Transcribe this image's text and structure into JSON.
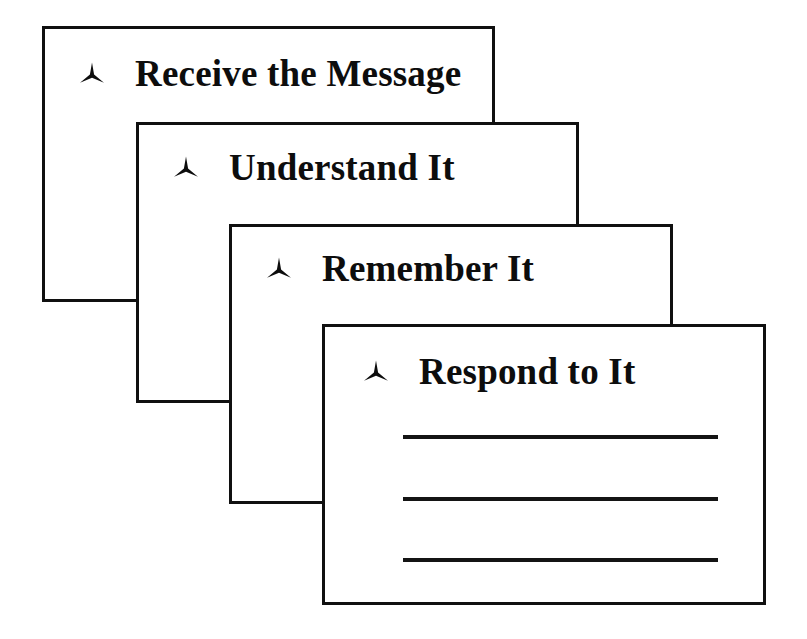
{
  "diagram": {
    "background_color": "#ffffff",
    "line_color": "#101010",
    "text_color": "#0d0d0d",
    "bullet_icon": "three-pointed-star-icon",
    "cards": [
      {
        "id": "card-1",
        "order": 1,
        "title": "Receive the Message",
        "bullet": "three-pointed-star-icon",
        "rule_lines": 0
      },
      {
        "id": "card-2",
        "order": 2,
        "title": "Understand It",
        "bullet": "three-pointed-star-icon",
        "rule_lines": 0
      },
      {
        "id": "card-3",
        "order": 3,
        "title": "Remember It",
        "bullet": "three-pointed-star-icon",
        "rule_lines": 0
      },
      {
        "id": "card-4",
        "order": 4,
        "title": "Respond to It",
        "bullet": "three-pointed-star-icon",
        "rule_lines": 3
      }
    ]
  }
}
